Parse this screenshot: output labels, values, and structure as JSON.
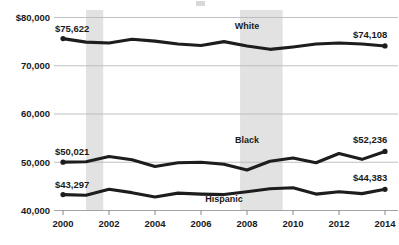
{
  "chart_data": {
    "type": "line",
    "title": "",
    "xlabel": "",
    "ylabel": "",
    "x": [
      2000,
      2001,
      2002,
      2003,
      2004,
      2005,
      2006,
      2007,
      2008,
      2009,
      2010,
      2011,
      2012,
      2013,
      2014
    ],
    "xlim": [
      2000,
      2014
    ],
    "ylim": [
      40000,
      80000
    ],
    "ytick_values": [
      40000,
      50000,
      60000,
      70000,
      80000
    ],
    "ytick_labels": [
      "40,000",
      "50,000",
      "60,000",
      "70,000",
      "$80,000"
    ],
    "xtick_values": [
      2000,
      2002,
      2004,
      2006,
      2008,
      2010,
      2012,
      2014
    ],
    "xtick_labels": [
      "2000",
      "2002",
      "2004",
      "2006",
      "2008",
      "2010",
      "2012",
      "2014"
    ],
    "grid": true,
    "legend_position": "inline-labels",
    "series": [
      {
        "name": "White",
        "label": "White",
        "label_x": 2008,
        "label_y": 77600,
        "color": "#1d1d1d",
        "start_label": "$75,622",
        "end_label": "$74,108",
        "values": [
          75622,
          74900,
          74700,
          75500,
          75100,
          74500,
          74200,
          75000,
          74100,
          73400,
          73900,
          74500,
          74700,
          74500,
          74108
        ]
      },
      {
        "name": "Black",
        "label": "Black",
        "label_x": 2008,
        "label_y": 53900,
        "color": "#1d1d1d",
        "start_label": "$50,021",
        "end_label": "$52,236",
        "values": [
          50021,
          50100,
          51200,
          50500,
          49100,
          49900,
          50000,
          49600,
          48400,
          50200,
          50900,
          49900,
          51800,
          50600,
          52236
        ]
      },
      {
        "name": "Hispanic",
        "label": "Hispanic",
        "label_x": 2007,
        "label_y": 41700,
        "color": "#1d1d1d",
        "start_label": "$43,297",
        "end_label": "$44,383",
        "values": [
          43297,
          43150,
          44400,
          43700,
          42800,
          43600,
          43400,
          43300,
          43900,
          44500,
          44700,
          43400,
          43900,
          43500,
          44383
        ]
      }
    ],
    "recession_bands": [
      {
        "name": "recession-2001",
        "start": 2001.0,
        "end": 2001.75
      },
      {
        "name": "recession-2008",
        "start": 2007.7,
        "end": 2009.55
      }
    ],
    "colors": {
      "line": "#1d1d1d",
      "grid": "#b9b9b9",
      "recession": "#e2e2e2",
      "background": "#ffffff",
      "text": "#1a1a1a"
    }
  }
}
